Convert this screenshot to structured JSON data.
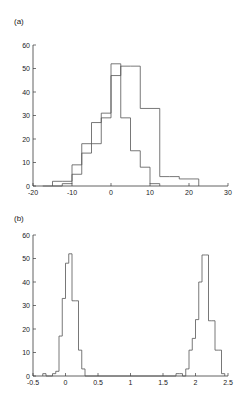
{
  "figure": {
    "panel_a_label": "(a)",
    "panel_b_label": "(b)"
  },
  "chart_data": [
    {
      "type": "bar",
      "panel": "(a)",
      "title": "",
      "xlabel": "",
      "ylabel": "",
      "grid": false,
      "legend": "none",
      "xlim": [
        -20,
        30
      ],
      "ylim": [
        0,
        60
      ],
      "xticks": [
        -20,
        -10,
        0,
        10,
        20,
        30
      ],
      "xticklabels": [
        "-20",
        "-10",
        "0",
        "10",
        "20",
        "30"
      ],
      "yticks": [
        0,
        10,
        20,
        30,
        40,
        50,
        60
      ],
      "yticklabels": [
        "0",
        "10",
        "20",
        "30",
        "40",
        "50",
        "60"
      ],
      "bin_width": 2.5,
      "series": [
        {
          "name": "distribution-1",
          "bin_edges": [
            -17.5,
            -15,
            -12.5,
            -10,
            -7.5,
            -5,
            -2.5,
            0,
            2.5,
            5,
            7.5,
            10,
            12.5
          ],
          "values": [
            0,
            2,
            2,
            9,
            18,
            18,
            29,
            52,
            29,
            15,
            8,
            1
          ]
        },
        {
          "name": "distribution-2",
          "bin_edges": [
            -15,
            -12.5,
            -10,
            -7.5,
            -5,
            -2.5,
            0,
            2.5,
            5,
            7.5,
            10,
            12.5,
            15,
            17.5,
            20,
            22.5
          ],
          "values": [
            0,
            1,
            5,
            14,
            27,
            31,
            47,
            51,
            51,
            33,
            33,
            4,
            4,
            3,
            3
          ]
        }
      ]
    },
    {
      "type": "bar",
      "panel": "(b)",
      "title": "",
      "xlabel": "",
      "ylabel": "",
      "grid": false,
      "legend": "none",
      "xlim": [
        -0.5,
        2.5
      ],
      "ylim": [
        0,
        60
      ],
      "xticks": [
        -0.5,
        0,
        0.5,
        1,
        1.5,
        2,
        2.5
      ],
      "xticklabels": [
        "-0.5",
        "0",
        "0.5",
        "1",
        "1.5",
        "2",
        "2.5"
      ],
      "yticks": [
        0,
        10,
        20,
        30,
        40,
        50,
        60
      ],
      "yticklabels": [
        "0",
        "10",
        "20",
        "30",
        "40",
        "50",
        "60"
      ],
      "bin_width": 0.05,
      "series": [
        {
          "name": "bimodal-distribution",
          "bin_edges": [
            -0.35,
            -0.3,
            -0.25,
            -0.2,
            -0.15,
            -0.1,
            -0.05,
            0.0,
            0.05,
            0.1,
            0.15,
            0.2,
            0.25,
            0.3,
            1.7,
            1.75,
            1.8,
            1.85,
            1.9,
            1.95,
            2.0,
            2.05,
            2.1,
            2.15,
            2.2,
            2.25,
            2.3,
            2.35,
            2.4,
            2.45
          ],
          "values": [
            1,
            0,
            0,
            1,
            2,
            17,
            33,
            48,
            52,
            32,
            32,
            11,
            3,
            0,
            1,
            1,
            0,
            3,
            11,
            16,
            24,
            40,
            51.5,
            51.5,
            23.5,
            23.5,
            11,
            11,
            1
          ]
        }
      ]
    }
  ]
}
